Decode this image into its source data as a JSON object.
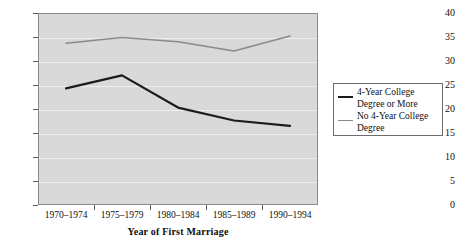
{
  "chart_data": {
    "type": "line",
    "title": "",
    "xlabel": "Year of First Marriage",
    "ylabel": "",
    "categories": [
      "1970–1974",
      "1975–1979",
      "1980–1984",
      "1985–1989",
      "1990–1994"
    ],
    "ylim": [
      0,
      40
    ],
    "ytick_labels": [
      "0",
      "5",
      "10",
      "15",
      "20",
      "25",
      "30",
      "35",
      "40"
    ],
    "yticks": [
      0,
      5,
      10,
      15,
      20,
      25,
      30,
      35,
      40
    ],
    "grid": true,
    "legend_position": "right",
    "series": [
      {
        "name": "4-Year College Degree or More",
        "color": "#1c1c1c",
        "width": 2.2,
        "values": [
          24.3,
          27.0,
          20.3,
          17.6,
          16.5
        ]
      },
      {
        "name": "No 4-Year College Degree",
        "color": "#8a8a8a",
        "width": 1.6,
        "values": [
          33.7,
          34.9,
          34.0,
          32.1,
          35.2
        ]
      }
    ],
    "plot_background": "#d9d9d9",
    "gridline_color": "#efefef",
    "frame_color": "#8a8a8a"
  },
  "legend": {
    "entries": [
      {
        "label": "4-Year College Degree or More"
      },
      {
        "label": "No 4-Year College Degree"
      }
    ]
  },
  "axis": {
    "x_title": "Year of First Marriage"
  }
}
